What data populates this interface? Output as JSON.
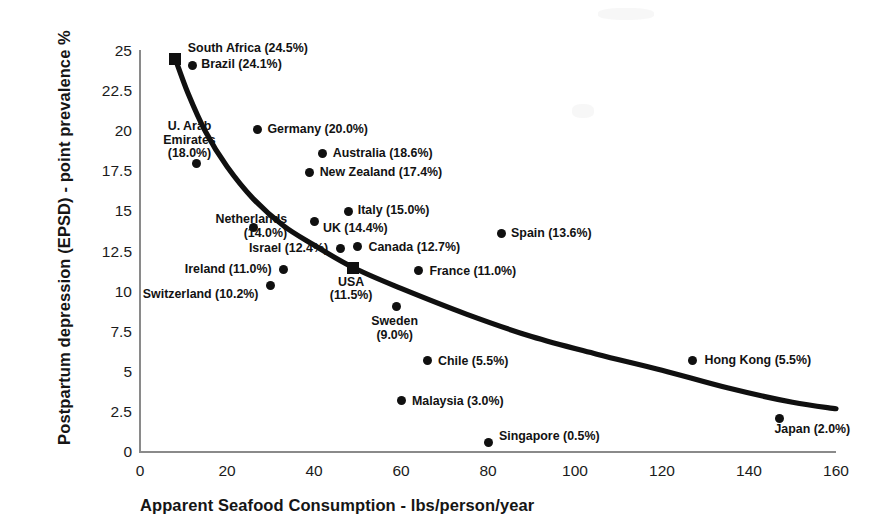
{
  "chart_data": {
    "type": "scatter",
    "title": "",
    "xlabel": "Apparent Seafood Consumption - lbs/person/year",
    "ylabel": "Postpartum depression (EPSD) - point prevalence  %",
    "xlim": [
      0,
      160
    ],
    "ylim": [
      0,
      25
    ],
    "xticks": [
      "0",
      "20",
      "40",
      "60",
      "80",
      "100",
      "120",
      "140",
      "160"
    ],
    "yticks": [
      "0",
      "2.5",
      "5",
      "7.5",
      "10",
      "12.5",
      "15",
      "17.5",
      "20",
      "22.5",
      "25"
    ],
    "grid": false,
    "legend": "none",
    "marker_color": "#101010",
    "trend_color": "#101010",
    "points": [
      {
        "name": "South Africa",
        "value": "24.5%",
        "label": "South Africa (24.5%)",
        "x": 8,
        "y": 24.5,
        "marker": "square"
      },
      {
        "name": "Brazil",
        "value": "24.1%",
        "label": "Brazil (24.1%)",
        "x": 12,
        "y": 24.1,
        "marker": "circle"
      },
      {
        "name": "Germany",
        "value": "20.0%",
        "label": "Germany (20.0%)",
        "x": 27,
        "y": 20.1,
        "marker": "circle"
      },
      {
        "name": "Australia",
        "value": "18.6%",
        "label": "Australia (18.6%)",
        "x": 42,
        "y": 18.6,
        "marker": "circle"
      },
      {
        "name": "U. Arab Emirates",
        "value": "18.0%",
        "label": "U. Arab Emirates (18.0%)",
        "x": 13,
        "y": 18.0,
        "marker": "circle"
      },
      {
        "name": "New Zealand",
        "value": "17.4%",
        "label": "New Zealand (17.4%)",
        "x": 39,
        "y": 17.4,
        "marker": "circle"
      },
      {
        "name": "Italy",
        "value": "15.0%",
        "label": "Italy (15.0%)",
        "x": 48,
        "y": 15.0,
        "marker": "circle"
      },
      {
        "name": "UK",
        "value": "14.4%",
        "label": "UK (14.4%)",
        "x": 40,
        "y": 14.4,
        "marker": "circle"
      },
      {
        "name": "Netherlands",
        "value": "14.0%",
        "label": "Netherlands (14.0%)",
        "x": 26,
        "y": 14.0,
        "marker": "circle"
      },
      {
        "name": "Spain",
        "value": "13.6%",
        "label": "Spain (13.6%)",
        "x": 83,
        "y": 13.6,
        "marker": "circle"
      },
      {
        "name": "Canada",
        "value": "12.7%",
        "label": "Canada (12.7%)",
        "x": 50,
        "y": 12.8,
        "marker": "circle"
      },
      {
        "name": "Israel",
        "value": "12.4%",
        "label": "Israel (12.4%)",
        "x": 46,
        "y": 12.7,
        "marker": "circle"
      },
      {
        "name": "USA",
        "value": "11.5%",
        "label": "USA (11.5%)",
        "x": 49,
        "y": 11.5,
        "marker": "square"
      },
      {
        "name": "France",
        "value": "11.0%",
        "label": "France (11.0%)",
        "x": 64,
        "y": 11.3,
        "marker": "circle"
      },
      {
        "name": "Ireland",
        "value": "11.0%",
        "label": "Ireland (11.0%)",
        "x": 33,
        "y": 11.4,
        "marker": "circle"
      },
      {
        "name": "Switzerland",
        "value": "10.2%",
        "label": "Switzerland (10.2%)",
        "x": 30,
        "y": 10.4,
        "marker": "circle"
      },
      {
        "name": "Sweden",
        "value": "9.0%",
        "label": "Sweden (9.0%)",
        "x": 59,
        "y": 9.1,
        "marker": "circle"
      },
      {
        "name": "Chile",
        "value": "5.5%",
        "label": "Chile (5.5%)",
        "x": 66,
        "y": 5.7,
        "marker": "circle"
      },
      {
        "name": "Hong Kong",
        "value": "5.5%",
        "label": "Hong Kong (5.5%)",
        "x": 127,
        "y": 5.7,
        "marker": "circle"
      },
      {
        "name": "Malaysia",
        "value": "3.0%",
        "label": "Malaysia (3.0%)",
        "x": 60,
        "y": 3.2,
        "marker": "circle"
      },
      {
        "name": "Japan",
        "value": "2.0%",
        "label": "Japan (2.0%)",
        "x": 147,
        "y": 2.1,
        "marker": "circle"
      },
      {
        "name": "Singapore",
        "value": "0.5%",
        "label": "Singapore (0.5%)",
        "x": 80,
        "y": 0.6,
        "marker": "circle"
      }
    ],
    "trend_line": {
      "description": "Fitted decreasing power curve through the point cloud",
      "points": [
        {
          "x": 8,
          "y": 24.6
        },
        {
          "x": 11,
          "y": 22.4
        },
        {
          "x": 15,
          "y": 20.0
        },
        {
          "x": 20,
          "y": 17.8
        },
        {
          "x": 26,
          "y": 15.8
        },
        {
          "x": 33,
          "y": 14.1
        },
        {
          "x": 40,
          "y": 12.9
        },
        {
          "x": 49,
          "y": 11.5
        },
        {
          "x": 60,
          "y": 10.2
        },
        {
          "x": 75,
          "y": 8.6
        },
        {
          "x": 90,
          "y": 7.2
        },
        {
          "x": 105,
          "y": 6.1
        },
        {
          "x": 120,
          "y": 5.1
        },
        {
          "x": 135,
          "y": 4.0
        },
        {
          "x": 150,
          "y": 3.1
        },
        {
          "x": 160,
          "y": 2.7
        }
      ]
    }
  }
}
